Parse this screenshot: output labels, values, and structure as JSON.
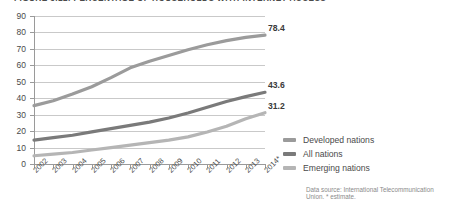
{
  "figure": {
    "title": "FIGURE 3.12. PERCENTAGE OF HOUSEHOLDS WITH INTERNET ACCESS",
    "source_note": "Data source: International Telecommunication Union. * estimate."
  },
  "chart_data": {
    "type": "line",
    "title": "FIGURE 3.12. PERCENTAGE OF HOUSEHOLDS WITH INTERNET ACCESS",
    "xlabel": "",
    "ylabel": "",
    "grid": true,
    "legend_position": "right",
    "ylim": [
      0,
      90
    ],
    "yticks": [
      0,
      10,
      20,
      30,
      40,
      50,
      60,
      70,
      80,
      90
    ],
    "ytick_labels": [
      "0",
      "10",
      "20",
      "30",
      "40",
      "50",
      "60",
      "70",
      "80",
      "90"
    ],
    "categories": [
      "2002",
      "2003",
      "2004",
      "2005",
      "2006",
      "2007",
      "2008",
      "2009",
      "2010",
      "2011",
      "2012",
      "2013",
      "2014*"
    ],
    "series": [
      {
        "name": "Developed nations",
        "color": "#9b9b9b",
        "values": [
          35.5,
          38.5,
          42.5,
          47.0,
          52.5,
          58.5,
          62.5,
          66.0,
          69.5,
          72.5,
          75.0,
          77.0,
          78.4
        ],
        "end_label": "78.4"
      },
      {
        "name": "All nations",
        "color": "#7a7a7a",
        "values": [
          14.5,
          16.0,
          17.5,
          19.5,
          21.5,
          23.5,
          25.5,
          28.0,
          31.0,
          34.5,
          38.0,
          41.0,
          43.6
        ],
        "end_label": "43.6"
      },
      {
        "name": "Emerging nations",
        "color": "#b5b5b5",
        "values": [
          5.0,
          6.0,
          7.0,
          8.5,
          10.0,
          11.5,
          13.0,
          14.5,
          16.5,
          19.5,
          23.0,
          27.5,
          31.2
        ],
        "end_label": "31.2"
      }
    ]
  },
  "legend": {
    "items": [
      {
        "label": "Developed nations",
        "color": "#9b9b9b"
      },
      {
        "label": "All nations",
        "color": "#7a7a7a"
      },
      {
        "label": "Emerging nations",
        "color": "#b5b5b5"
      }
    ]
  }
}
